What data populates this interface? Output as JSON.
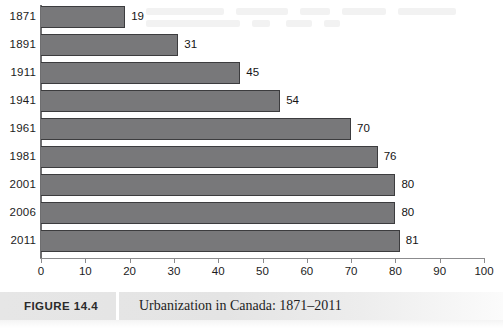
{
  "figure": {
    "number_label": "FIGURE 14.4",
    "title": "Urbanization in Canada: 1871–2011"
  },
  "colors": {
    "bar_fill": "#78787a",
    "bar_stroke": "#3c3c3e",
    "axis": "#8b8b8d",
    "caption_band": "#e6e6e6",
    "text": "#1a1a1a"
  },
  "chart_data": {
    "type": "bar",
    "orientation": "horizontal",
    "title": "Urbanization in Canada: 1871–2011",
    "xlabel": "",
    "ylabel": "",
    "xlim": [
      0,
      100
    ],
    "grid": false,
    "legend": null,
    "categories": [
      "1871",
      "1891",
      "1911",
      "1941",
      "1961",
      "1981",
      "2001",
      "2006",
      "2011"
    ],
    "values": [
      19,
      31,
      45,
      54,
      70,
      76,
      80,
      80,
      81
    ],
    "data_labels": [
      "19",
      "31",
      "45",
      "54",
      "70",
      "76",
      "80",
      "80",
      "81"
    ],
    "xticks": [
      0,
      10,
      20,
      30,
      40,
      50,
      60,
      70,
      80,
      90,
      100
    ],
    "xtick_labels": [
      "0",
      "10",
      "20",
      "30",
      "40",
      "50",
      "60",
      "70",
      "80",
      "90",
      "100"
    ]
  }
}
